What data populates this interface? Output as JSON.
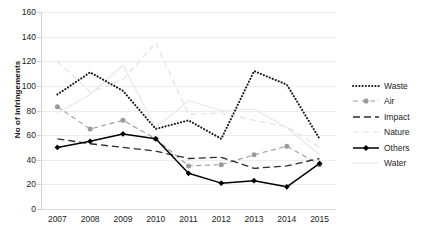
{
  "chart_data": {
    "type": "line",
    "title": "",
    "xlabel": "",
    "ylabel": "No of Infringements",
    "categories": [
      "2007",
      "2008",
      "2009",
      "2010",
      "2011",
      "2012",
      "2013",
      "2014",
      "2015"
    ],
    "x": [
      2007,
      2008,
      2009,
      2010,
      2011,
      2012,
      2013,
      2014,
      2015
    ],
    "ylim": [
      0,
      160
    ],
    "ytick_step": 20,
    "yticks": [
      0,
      20,
      40,
      60,
      80,
      100,
      120,
      140,
      160
    ],
    "grid": true,
    "legend_position": "right",
    "series": [
      {
        "name": "Waste",
        "values": [
          93,
          111,
          96,
          65,
          72,
          57,
          112,
          101,
          57
        ],
        "color": "#1a1a1a",
        "style": "dotted",
        "marker": "none"
      },
      {
        "name": "Air",
        "values": [
          83,
          65,
          72,
          57,
          35,
          36,
          44,
          51,
          36
        ],
        "color": "#9a9a9a",
        "style": "dashed",
        "marker": "circle"
      },
      {
        "name": "Impact",
        "values": [
          57,
          53,
          50,
          47,
          41,
          42,
          33,
          35,
          41
        ],
        "color": "#2b2b2b",
        "style": "long-dashed",
        "marker": "none"
      },
      {
        "name": "Nature",
        "values": [
          120,
          95,
          105,
          135,
          77,
          78,
          72,
          67,
          50
        ],
        "color": "#e2e2e2",
        "style": "dashed-light",
        "marker": "none"
      },
      {
        "name": "Others",
        "values": [
          50,
          55,
          61,
          57,
          29,
          21,
          23,
          18,
          37
        ],
        "color": "#000000",
        "style": "solid",
        "marker": "diamond"
      },
      {
        "name": "Water",
        "values": [
          78,
          93,
          117,
          66,
          88,
          80,
          81,
          66,
          44
        ],
        "color": "#e8e8e8",
        "style": "solid-light",
        "marker": "none"
      }
    ]
  },
  "legend": {
    "items": [
      {
        "label": "Waste"
      },
      {
        "label": "Air"
      },
      {
        "label": "Impact"
      },
      {
        "label": "Nature"
      },
      {
        "label": "Others"
      },
      {
        "label": "Water"
      }
    ]
  }
}
